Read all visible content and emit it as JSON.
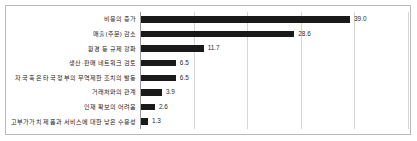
{
  "chart_data": {
    "type": "bar",
    "orientation": "horizontal",
    "title": "",
    "subtitle": "",
    "xlabel": "",
    "ylabel": "",
    "categories": [
      "비용의 증가",
      "매출(주문) 감소",
      "환경 등 규제 강화",
      "생산·판매 네트워크 검토",
      "자국 혹은 타국 정부의 무역제한 조치의 발동",
      "거래처와의 관계",
      "인재 확보의 어려움",
      "고부가가치 제품과 서비스에 대한 낮은 수용성"
    ],
    "values": [
      39.0,
      28.6,
      11.7,
      6.5,
      6.5,
      3.9,
      2.6,
      1.3
    ],
    "value_labels": [
      "39.0",
      "28.6",
      "11.7",
      "6.5",
      "6.5",
      "3.9",
      "2.6",
      "1.3"
    ],
    "xlim": [
      0,
      50
    ],
    "gridline_values": [
      10,
      20,
      30,
      40,
      50
    ],
    "grid": true,
    "legend": false,
    "bar_color": "#1a1a1a",
    "grid_color": "#d6d6d6",
    "axis_color": "#9a9a9a",
    "border_color": "#b9b9b9",
    "background_color": "#ffffff",
    "label_color": "#1c1c1c",
    "value_label_color": "#2b2b2b"
  }
}
